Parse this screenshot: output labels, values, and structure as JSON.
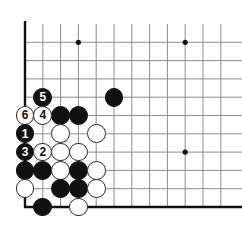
{
  "figure": {
    "kind": "go-board-diagram",
    "title": "",
    "width": 242,
    "height": 237
  },
  "board": {
    "size": 19,
    "visible_columns": 12,
    "visible_rows": 11,
    "origin_x": 25,
    "origin_y": 24,
    "spacing_x": 17.8,
    "spacing_y": 18.3,
    "line_color": "#8c8c8c",
    "edge_color": "#111111",
    "background_color": "#ffffff",
    "line_width": 1,
    "edge_width": 2.4,
    "star_point_radius": 2.6,
    "star_points": [
      {
        "col": 4,
        "row": 2
      },
      {
        "col": 10,
        "row": 2
      },
      {
        "col": 10,
        "row": 8
      }
    ]
  },
  "stones": {
    "radius": 9.4,
    "black_color": "#111111",
    "white_color": "#ffffff",
    "white_border_color": "#2b2b2b",
    "items": [
      {
        "col": 2,
        "row": 5,
        "color": "black",
        "label": "5"
      },
      {
        "col": 6,
        "row": 5,
        "color": "black",
        "label": ""
      },
      {
        "col": 1,
        "row": 6,
        "color": "white",
        "label": "6"
      },
      {
        "col": 2,
        "row": 6,
        "color": "white",
        "label": "4"
      },
      {
        "col": 3,
        "row": 6,
        "color": "black",
        "label": ""
      },
      {
        "col": 4,
        "row": 6,
        "color": "black",
        "label": ""
      },
      {
        "col": 1,
        "row": 7,
        "color": "black",
        "label": "1"
      },
      {
        "col": 3,
        "row": 7,
        "color": "white",
        "label": ""
      },
      {
        "col": 5,
        "row": 7,
        "color": "white",
        "label": ""
      },
      {
        "col": 1,
        "row": 8,
        "color": "black",
        "label": "3"
      },
      {
        "col": 2,
        "row": 8,
        "color": "white",
        "label": "2"
      },
      {
        "col": 3,
        "row": 8,
        "color": "white",
        "label": ""
      },
      {
        "col": 4,
        "row": 8,
        "color": "white",
        "label": ""
      },
      {
        "col": 1,
        "row": 9,
        "color": "black",
        "label": ""
      },
      {
        "col": 2,
        "row": 9,
        "color": "black",
        "label": ""
      },
      {
        "col": 3,
        "row": 9,
        "color": "white",
        "label": ""
      },
      {
        "col": 4,
        "row": 9,
        "color": "black",
        "label": ""
      },
      {
        "col": 5,
        "row": 9,
        "color": "white",
        "label": ""
      },
      {
        "col": 1,
        "row": 10,
        "color": "white",
        "label": ""
      },
      {
        "col": 3,
        "row": 10,
        "color": "black",
        "label": ""
      },
      {
        "col": 4,
        "row": 10,
        "color": "black",
        "label": ""
      },
      {
        "col": 5,
        "row": 10,
        "color": "white",
        "label": ""
      },
      {
        "col": 2,
        "row": 11,
        "color": "black",
        "label": ""
      },
      {
        "col": 4,
        "row": 11,
        "color": "white",
        "label": ""
      }
    ]
  },
  "move_sequence": [
    {
      "number": "1",
      "color": "black"
    },
    {
      "number": "2",
      "color": "white"
    },
    {
      "number": "3",
      "color": "black"
    },
    {
      "number": "4",
      "color": "white"
    },
    {
      "number": "5",
      "color": "black"
    },
    {
      "number": "6",
      "color": "white"
    }
  ]
}
